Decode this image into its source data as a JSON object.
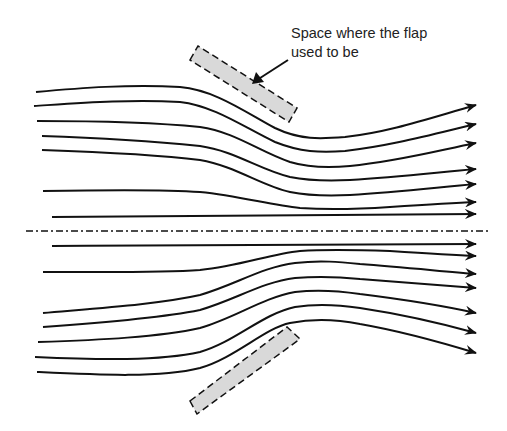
{
  "diagram": {
    "type": "streamline-flow-diagram",
    "annotation": {
      "line1": "Space where the flap",
      "line2": "used to be"
    },
    "colors": {
      "stroke": "#111111",
      "flap_fill": "#d9d9d9",
      "background": "#ffffff"
    },
    "upper_streamlines": [
      {
        "start": [
          36,
          92
        ],
        "end_y": 105
      },
      {
        "start": [
          34,
          106
        ],
        "end_y": 124
      },
      {
        "start": [
          37,
          121
        ],
        "end_y": 143
      },
      {
        "start": [
          42,
          136
        ],
        "end_y": 169
      },
      {
        "start": [
          42,
          150
        ],
        "end_y": 184
      },
      {
        "start": [
          43,
          191
        ],
        "end_y": 202
      },
      {
        "start": [
          52,
          217
        ],
        "end_y": 214
      }
    ],
    "lower_streamlines": [
      {
        "start": [
          52,
          246
        ],
        "end_y": 244
      },
      {
        "start": [
          43,
          272
        ],
        "end_y": 256
      },
      {
        "start": [
          43,
          313
        ],
        "end_y": 274
      },
      {
        "start": [
          43,
          327
        ],
        "end_y": 288
      },
      {
        "start": [
          38,
          342
        ],
        "end_y": 313
      },
      {
        "start": [
          35,
          357
        ],
        "end_y": 333
      },
      {
        "start": [
          37,
          372
        ],
        "end_y": 353
      }
    ],
    "centerline": {
      "y": 231,
      "x_start": 26,
      "x_end": 490,
      "style": "dash-dot"
    },
    "flaps": [
      {
        "name": "upper-flap-space",
        "from": [
          194,
          53
        ],
        "to": [
          293,
          115
        ],
        "width": 15
      },
      {
        "name": "lower-flap-space",
        "from": [
          194,
          407
        ],
        "to": [
          295,
          333
        ],
        "width": 15
      }
    ]
  }
}
